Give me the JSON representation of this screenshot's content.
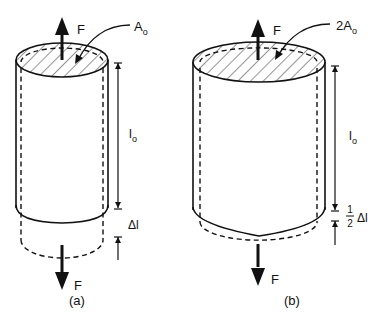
{
  "figure": {
    "panels": [
      {
        "id": "a",
        "caption": "(a)",
        "area_label": "A",
        "area_sub": "o",
        "force_top": "F",
        "force_bottom": "F",
        "length_label": "l",
        "length_sub": "o",
        "elongation_label": "Δl"
      },
      {
        "id": "b",
        "caption": "(b)",
        "area_label": "2A",
        "area_sub": "o",
        "force_top": "F",
        "force_bottom": "F",
        "length_label": "l",
        "length_sub": "o",
        "elongation_num": "1",
        "elongation_den": "2",
        "elongation_label": "Δl"
      }
    ],
    "colors": {
      "stroke": "#111111",
      "background": "#ffffff"
    }
  }
}
